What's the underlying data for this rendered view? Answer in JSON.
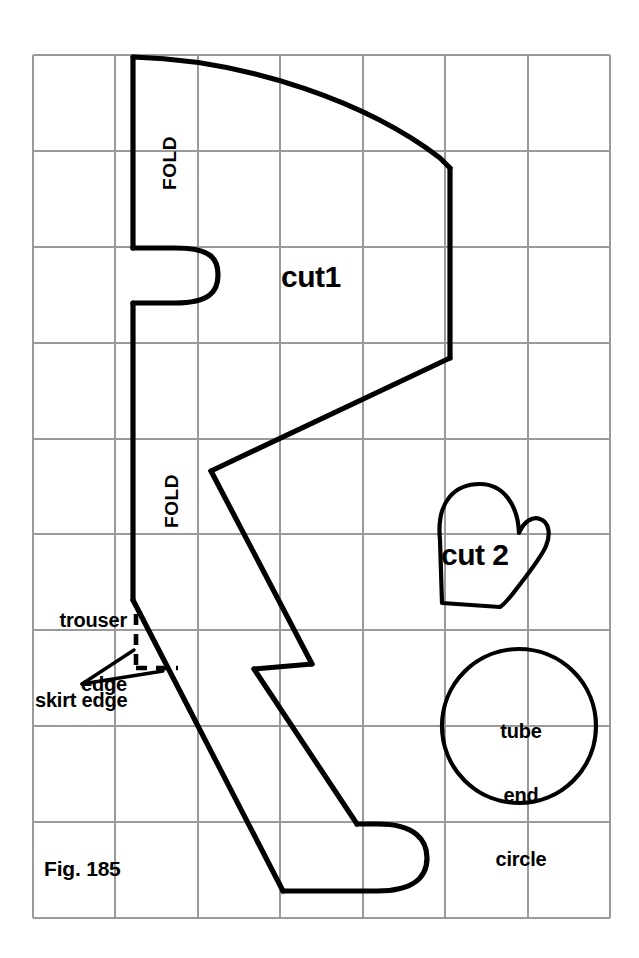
{
  "figure": {
    "caption": "Fig. 185",
    "background_color": "#ffffff",
    "ink_color": "#000000",
    "grid_color": "#9a9a9a"
  },
  "grid": {
    "columns": 7,
    "rows": 9,
    "left": 33,
    "top": 55,
    "right": 610,
    "bottom": 918,
    "cell_width": 82.4,
    "cell_height": 95.9
  },
  "labels": {
    "fold_upper": "FOLD",
    "fold_lower": "FOLD",
    "cut1": "cut1",
    "cut2": "cut 2",
    "tube_end_circle_line1": "tube",
    "tube_end_circle_line2": "end",
    "tube_end_circle_line3": "circle",
    "trouser_edge_line1": "trouser",
    "trouser_edge_line2": "edge",
    "skirt_edge": "skirt edge",
    "figure_caption": "Fig. 185"
  },
  "pieces": [
    {
      "name": "main-body-piece",
      "label": "cut1",
      "description": "Large folded body/leg pattern piece with placket notch, zigzag side seam and rounded foot"
    },
    {
      "name": "mitten-piece",
      "label": "cut 2",
      "description": "Mitten shaped hand piece with thumb"
    },
    {
      "name": "tube-end-circle-piece",
      "label": "tube end circle",
      "description": "Circular tube end pattern piece"
    }
  ],
  "annotations": [
    {
      "name": "trouser-edge",
      "text": "trouser edge",
      "style": "solid"
    },
    {
      "name": "skirt-edge",
      "text": "skirt edge",
      "style": "dashed-with-leader"
    }
  ]
}
